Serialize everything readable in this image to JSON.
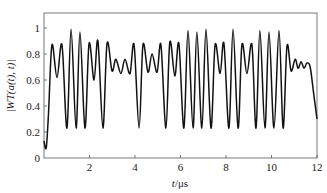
{
  "chart_data": {
    "type": "line",
    "title": "",
    "xlabel": "t/μs",
    "ylabel": "|WT(a(t), t)|",
    "xlim": [
      0,
      12
    ],
    "ylim": [
      0,
      1.05
    ],
    "xticks": [
      2,
      4,
      6,
      8,
      10,
      12
    ],
    "yticks": [
      0,
      0.2,
      0.4,
      0.6,
      0.8,
      1
    ],
    "ytick_labels": [
      "0",
      "0.2",
      "0.4",
      "0.6",
      "0.8",
      "1"
    ],
    "xtick_labels": [
      "2",
      "4",
      "6",
      "8",
      "10",
      "12"
    ],
    "grid": false,
    "legend": null,
    "line_color": "#111111",
    "series": [
      {
        "name": "|WT(a(t), t)|",
        "x": [
          0.0,
          0.1,
          0.2,
          0.35,
          0.57,
          0.79,
          1.01,
          1.19,
          1.41,
          1.58,
          1.8,
          1.98,
          2.2,
          2.37,
          2.59,
          2.77,
          2.99,
          3.16,
          3.38,
          3.56,
          3.78,
          3.96,
          4.18,
          4.35,
          4.57,
          4.75,
          4.97,
          5.14,
          5.36,
          5.53,
          5.75,
          5.93,
          6.15,
          6.33,
          6.55,
          6.72,
          6.94,
          7.12,
          7.34,
          7.52,
          7.74,
          7.91,
          8.13,
          8.31,
          8.53,
          8.7,
          8.92,
          9.14,
          9.32,
          9.49,
          9.71,
          9.89,
          10.11,
          10.33,
          10.51,
          10.68,
          10.86,
          11.04,
          11.17,
          11.3,
          11.43,
          11.56,
          11.7,
          11.85,
          12.0
        ],
        "y": [
          0.13,
          0.08,
          0.35,
          0.87,
          0.62,
          0.87,
          0.23,
          0.99,
          0.23,
          0.97,
          0.23,
          0.88,
          0.6,
          0.9,
          0.23,
          0.88,
          0.67,
          0.76,
          0.65,
          0.76,
          0.65,
          0.87,
          0.23,
          0.87,
          0.66,
          0.8,
          0.66,
          0.87,
          0.23,
          0.89,
          0.63,
          0.88,
          0.23,
          0.98,
          0.23,
          0.97,
          0.23,
          0.99,
          0.23,
          0.87,
          0.65,
          0.88,
          0.23,
          0.99,
          0.23,
          0.87,
          0.65,
          0.87,
          0.23,
          0.98,
          0.23,
          0.97,
          0.23,
          0.98,
          0.23,
          0.86,
          0.67,
          0.76,
          0.69,
          0.74,
          0.69,
          0.73,
          0.7,
          0.5,
          0.3
        ]
      }
    ]
  },
  "labels": {
    "xlabel_italic": "t",
    "xlabel_unit": "/μs",
    "ylabel": "|WT(a(t), t)|"
  }
}
